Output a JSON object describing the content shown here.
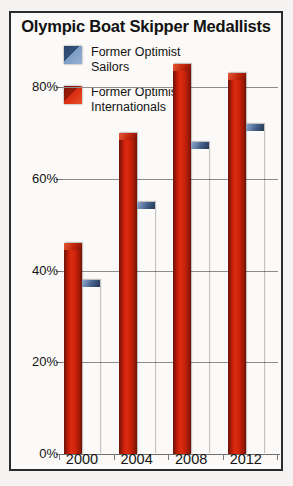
{
  "chart_data": {
    "type": "bar",
    "title": "Olympic Boat Skipper Medallists",
    "xlabel": "",
    "ylabel": "",
    "categories": [
      "2000",
      "2004",
      "2008",
      "2012"
    ],
    "series": [
      {
        "name": "Former Optimist Internationals",
        "color": "#c71d08",
        "values": [
          38,
          55,
          68,
          72
        ]
      },
      {
        "name": "Former Optimist Sailors",
        "color": "#7d9cc4",
        "values": [
          46,
          70,
          85,
          83
        ]
      }
    ],
    "ylim": [
      0,
      90
    ],
    "yticks": [
      0,
      20,
      40,
      60,
      80
    ],
    "ytick_labels": [
      "0%",
      "20%",
      "40%",
      "60%",
      "80%"
    ],
    "grid": true,
    "legend_position": "top-left"
  },
  "legend": {
    "items": [
      {
        "label_line1": "Former Optimist",
        "label_line2": "Sailors",
        "swatch": "blue-gradient-swatch"
      },
      {
        "label_line1": "Former Optimist",
        "label_line2": "Internationals",
        "swatch": "red-gradient-swatch"
      }
    ]
  }
}
